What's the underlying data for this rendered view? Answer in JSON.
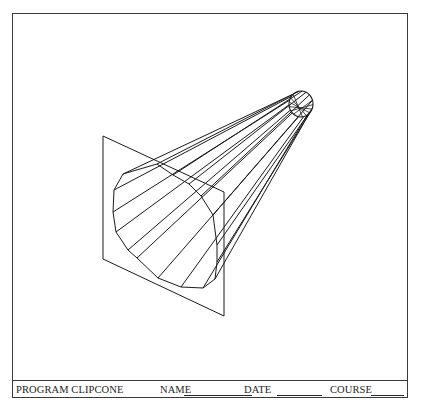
{
  "form": {
    "program_label": "PROGRAM CLIPCONE",
    "name_label": "NAME",
    "date_label": "DATE",
    "course_label": "COURSE",
    "name_value": "",
    "date_value": "",
    "course_value": ""
  },
  "figure": {
    "line_color": "#1a1a1a",
    "clip_plane": [
      [
        103,
        136
      ],
      [
        224,
        192
      ],
      [
        224,
        316
      ],
      [
        103,
        259
      ]
    ],
    "cut_section": [
      [
        157,
        164
      ],
      [
        123,
        174
      ],
      [
        114,
        190
      ],
      [
        113,
        212
      ],
      [
        116,
        232
      ],
      [
        128,
        250
      ],
      [
        137,
        258
      ],
      [
        158,
        278
      ],
      [
        181,
        287
      ],
      [
        203,
        288
      ],
      [
        215,
        279
      ],
      [
        217,
        262
      ],
      [
        217,
        245
      ],
      [
        213,
        215
      ],
      [
        201,
        196
      ],
      [
        189,
        184
      ],
      [
        173,
        175
      ]
    ],
    "apex_ellipse": {
      "cx": 301,
      "cy": 104,
      "rx": 12,
      "ry": 13
    },
    "generator_count": 17
  }
}
